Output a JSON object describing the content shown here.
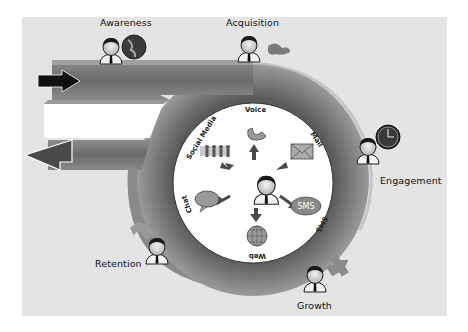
{
  "diagram": {
    "type": "customer-lifecycle",
    "stages": [
      {
        "id": "awareness",
        "label": "Awareness",
        "icon": "globe-icon"
      },
      {
        "id": "acquisition",
        "label": "Acquisition",
        "icon": "handshake-icon"
      },
      {
        "id": "engagement",
        "label": "Engagement",
        "icon": "clock-icon"
      },
      {
        "id": "growth",
        "label": "Growth",
        "icon": "plus-icon"
      },
      {
        "id": "retention",
        "label": "Retention",
        "icon": "magnet-icon"
      }
    ],
    "hub": {
      "center_icon": "agent-person-icon",
      "channels": [
        {
          "id": "voice",
          "label": "Voice",
          "icon": "phone-icon"
        },
        {
          "id": "mail",
          "label": "Mail",
          "icon": "envelope-icon"
        },
        {
          "id": "sms",
          "label": "SMS",
          "icon": "sms-bubble-icon",
          "icon_text": "SMS"
        },
        {
          "id": "web",
          "label": "Web",
          "icon": "globe-grid-icon"
        },
        {
          "id": "chat",
          "label": "Chat",
          "icon": "chat-bubble-icon"
        },
        {
          "id": "social",
          "label": "Social Media",
          "icon": "people-group-icon"
        }
      ]
    },
    "flow": {
      "entry_arrow": "arrow-right-in",
      "exit_arrow": "arrow-left-out"
    },
    "colors": {
      "background": "#e4e4e4",
      "band_dark": "#6e6e6e",
      "band_light": "#b8b8b8",
      "hub_fill": "#ffffff"
    }
  }
}
